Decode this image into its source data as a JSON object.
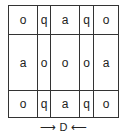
{
  "grid": {
    "rows": [
      [
        "o",
        "q",
        "a",
        "q",
        "o"
      ],
      [
        "a",
        "o",
        "o",
        "o",
        "a"
      ],
      [
        "o",
        "q",
        "a",
        "q",
        "o"
      ]
    ]
  },
  "caption": {
    "left_arrow": "⟶",
    "label": "D",
    "right_arrow": "⟵"
  }
}
